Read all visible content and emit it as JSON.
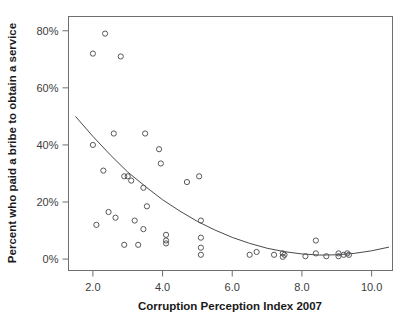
{
  "figure": {
    "background_color": "#ffffff",
    "marker_color": "#58585c",
    "line_color": "#4a4a4a",
    "frame_color": "#6e6e6e"
  },
  "chart_data": {
    "type": "scatter",
    "title": "",
    "subtitle": "",
    "xlabel": "Corruption Perception Index 2007",
    "ylabel": "Percent who paid a bribe to obtain a service",
    "xlim": [
      1.3,
      10.6
    ],
    "ylim": [
      -4,
      85
    ],
    "grid": false,
    "legend": null,
    "legend_position": "none",
    "xticks": [
      2.0,
      4.0,
      6.0,
      8.0,
      10.0
    ],
    "xticklabels": [
      "2.0",
      "4.0",
      "6.0",
      "8.0",
      "10.0"
    ],
    "yticks": [
      0,
      20,
      40,
      60,
      80
    ],
    "yticklabels": [
      "0%",
      "20%",
      "40%",
      "60%",
      "80%"
    ],
    "marker": "open-circle",
    "points": [
      {
        "x": 2.35,
        "y": 79.0
      },
      {
        "x": 2.0,
        "y": 72.0
      },
      {
        "x": 2.8,
        "y": 71.0
      },
      {
        "x": 2.0,
        "y": 40.0
      },
      {
        "x": 2.6,
        "y": 44.0
      },
      {
        "x": 3.5,
        "y": 44.0
      },
      {
        "x": 3.9,
        "y": 38.5
      },
      {
        "x": 2.3,
        "y": 31.0
      },
      {
        "x": 2.9,
        "y": 29.0
      },
      {
        "x": 3.0,
        "y": 29.0
      },
      {
        "x": 3.1,
        "y": 27.5
      },
      {
        "x": 3.95,
        "y": 33.5
      },
      {
        "x": 3.45,
        "y": 25.0
      },
      {
        "x": 4.7,
        "y": 27.0
      },
      {
        "x": 5.05,
        "y": 29.0
      },
      {
        "x": 2.45,
        "y": 16.5
      },
      {
        "x": 2.65,
        "y": 14.5
      },
      {
        "x": 2.1,
        "y": 12.0
      },
      {
        "x": 3.2,
        "y": 13.5
      },
      {
        "x": 3.55,
        "y": 18.5
      },
      {
        "x": 3.45,
        "y": 10.5
      },
      {
        "x": 2.9,
        "y": 5.0
      },
      {
        "x": 3.3,
        "y": 5.0
      },
      {
        "x": 4.1,
        "y": 8.5
      },
      {
        "x": 4.1,
        "y": 6.5
      },
      {
        "x": 4.1,
        "y": 5.5
      },
      {
        "x": 5.1,
        "y": 13.5
      },
      {
        "x": 5.1,
        "y": 7.5
      },
      {
        "x": 5.1,
        "y": 4.0
      },
      {
        "x": 5.1,
        "y": 1.5
      },
      {
        "x": 6.5,
        "y": 1.5
      },
      {
        "x": 6.7,
        "y": 2.5
      },
      {
        "x": 7.2,
        "y": 1.5
      },
      {
        "x": 7.45,
        "y": 2.0
      },
      {
        "x": 7.45,
        "y": 0.8
      },
      {
        "x": 7.5,
        "y": 1.5
      },
      {
        "x": 8.1,
        "y": 1.0
      },
      {
        "x": 8.4,
        "y": 6.5
      },
      {
        "x": 8.4,
        "y": 2.0
      },
      {
        "x": 8.7,
        "y": 1.0
      },
      {
        "x": 9.05,
        "y": 2.0
      },
      {
        "x": 9.05,
        "y": 1.0
      },
      {
        "x": 9.2,
        "y": 1.5
      },
      {
        "x": 9.3,
        "y": 2.0
      },
      {
        "x": 9.35,
        "y": 1.5
      }
    ],
    "fit_curve": {
      "kind": "quadratic-trend",
      "note": "fitted trend line descending from about 50% at CPI 1.5 to near 1% at CPI 8.5, then rising slightly to about 4% at CPI 10.5",
      "x": [
        1.5,
        2.0,
        2.5,
        3.0,
        3.5,
        4.0,
        4.5,
        5.0,
        5.5,
        6.0,
        6.5,
        7.0,
        7.5,
        8.0,
        8.5,
        9.0,
        9.5,
        10.0,
        10.5
      ],
      "y": [
        50.0,
        43.0,
        36.5,
        30.5,
        25.5,
        20.8,
        16.8,
        13.2,
        10.2,
        7.6,
        5.5,
        3.8,
        2.6,
        1.8,
        1.4,
        1.5,
        2.0,
        2.9,
        4.2
      ]
    }
  }
}
